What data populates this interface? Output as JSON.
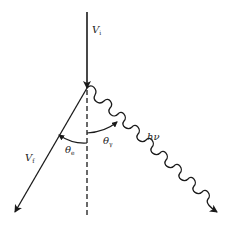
{
  "diagram": {
    "type": "scattering-geometry",
    "line_color": "#1a1a1a",
    "elements": {
      "incoming_electron": {
        "label_main": "V",
        "label_sub": "i"
      },
      "outgoing_electron": {
        "label_main": "V",
        "label_sub": "f"
      },
      "photon": {
        "label": "hν"
      },
      "electron_angle": {
        "label_main": "θ",
        "label_sub": "e"
      },
      "photon_angle": {
        "label_main": "θ",
        "label_sub": "γ"
      },
      "reference_axis": {
        "style": "dashed"
      }
    }
  }
}
